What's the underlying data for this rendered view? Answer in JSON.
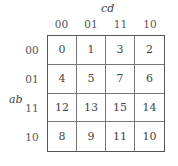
{
  "kmap": {
    "col_var": "cd",
    "row_var": "ab",
    "col_labels": [
      "00",
      "01",
      "11",
      "10"
    ],
    "row_labels": [
      "00",
      "01",
      "11",
      "10"
    ],
    "cells": [
      [
        "0",
        "1",
        "3",
        "2"
      ],
      [
        "4",
        "5",
        "7",
        "6"
      ],
      [
        "12",
        "13",
        "15",
        "14"
      ],
      [
        "8",
        "9",
        "11",
        "10"
      ]
    ]
  }
}
